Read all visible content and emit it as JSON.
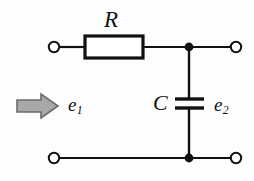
{
  "diagram": {
    "background_color": "#fdfdfd",
    "line_color": "#111111",
    "arrow_fill_color": "#a8a8a8",
    "arrow_stroke_color": "#555555",
    "component_fill_color": "#ffffff",
    "labels": {
      "resistor": "R",
      "capacitor": "C",
      "input_voltage": "e",
      "input_voltage_sub": "1",
      "output_voltage": "e",
      "output_voltage_sub": "2"
    },
    "icons": {
      "input_arrow": "right-arrow-icon",
      "resistor": "resistor-box-icon",
      "capacitor": "capacitor-plates-icon",
      "terminal": "open-terminal-circle-icon",
      "junction": "filled-junction-dot-icon"
    }
  }
}
